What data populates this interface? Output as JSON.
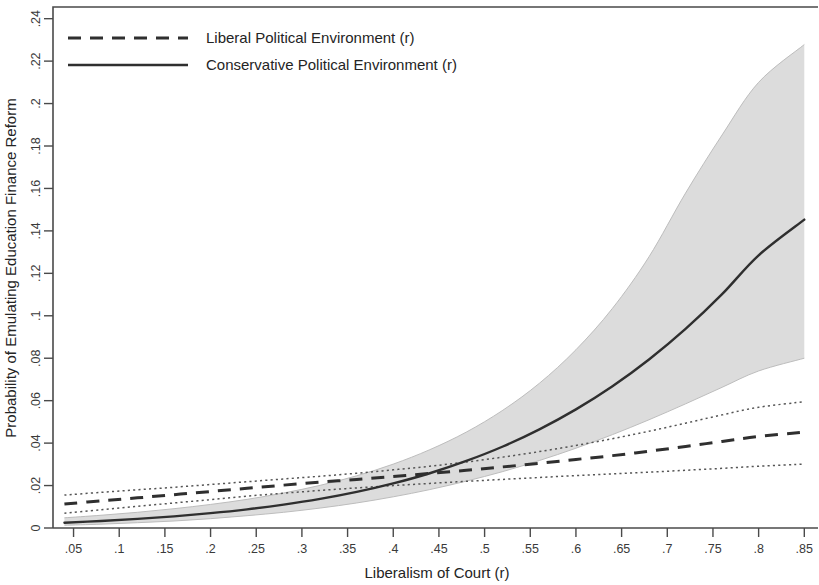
{
  "chart_data": {
    "type": "line",
    "title": "",
    "xlabel": "Liberalism of Court (r)",
    "ylabel": "Probability of Emulating Education Finance Reform",
    "xlim": [
      0.0275,
      0.865
    ],
    "ylim": [
      0,
      0.2455
    ],
    "grid": false,
    "legend_position": "top-left",
    "x_ticks": [
      0.05,
      0.1,
      0.15,
      0.2,
      0.25,
      0.3,
      0.35,
      0.4,
      0.45,
      0.5,
      0.55,
      0.6,
      0.65,
      0.7,
      0.75,
      0.8,
      0.85
    ],
    "x_tick_labels": [
      ".05",
      ".1",
      ".15",
      ".2",
      ".25",
      ".3",
      ".35",
      ".4",
      ".45",
      ".5",
      ".55",
      ".6",
      ".65",
      ".7",
      ".75",
      ".8",
      ".85"
    ],
    "y_ticks": [
      0,
      0.02,
      0.04,
      0.06,
      0.08,
      0.1,
      0.12,
      0.14,
      0.16,
      0.18,
      0.2,
      0.22,
      0.24
    ],
    "y_tick_labels": [
      "0",
      ".02",
      ".04",
      ".06",
      ".08",
      ".1",
      ".12",
      ".14",
      ".16",
      ".18",
      ".2",
      ".22",
      ".24"
    ],
    "x": [
      0.04,
      0.08,
      0.12,
      0.16,
      0.2,
      0.24,
      0.28,
      0.32,
      0.36,
      0.4,
      0.44,
      0.48,
      0.52,
      0.56,
      0.6,
      0.64,
      0.68,
      0.72,
      0.76,
      0.8,
      0.85
    ],
    "series": [
      {
        "name": "Liberal Political Environment (r)",
        "style": "dashed",
        "values": [
          0.0113,
          0.0128,
          0.0142,
          0.0157,
          0.0172,
          0.0187,
          0.0202,
          0.0216,
          0.0229,
          0.0243,
          0.0257,
          0.0272,
          0.0288,
          0.0305,
          0.0323,
          0.0341,
          0.0362,
          0.0384,
          0.0408,
          0.0431,
          0.0452
        ],
        "ci_upper": [
          0.0155,
          0.0168,
          0.018,
          0.0192,
          0.0205,
          0.0218,
          0.0231,
          0.0244,
          0.0258,
          0.0274,
          0.0291,
          0.0311,
          0.0334,
          0.036,
          0.0389,
          0.0421,
          0.0456,
          0.0494,
          0.0533,
          0.0569,
          0.0595
        ],
        "ci_lower": [
          0.007,
          0.0086,
          0.0102,
          0.0118,
          0.0134,
          0.015,
          0.0164,
          0.0177,
          0.0189,
          0.02,
          0.021,
          0.022,
          0.0229,
          0.0238,
          0.0247,
          0.0255,
          0.0263,
          0.0272,
          0.0281,
          0.0291,
          0.0301
        ],
        "ci_style": "dotted"
      },
      {
        "name": "Conservative Political Environment (r)",
        "style": "solid",
        "values": [
          0.0025,
          0.0033,
          0.0043,
          0.0055,
          0.007,
          0.0088,
          0.011,
          0.0137,
          0.017,
          0.021,
          0.0258,
          0.0316,
          0.0384,
          0.0465,
          0.0559,
          0.0668,
          0.0794,
          0.0938,
          0.1102,
          0.1285,
          0.1453
        ],
        "ci_upper": [
          0.0048,
          0.006,
          0.0074,
          0.0091,
          0.0111,
          0.0135,
          0.0165,
          0.0201,
          0.0246,
          0.0301,
          0.0369,
          0.0452,
          0.0555,
          0.0682,
          0.084,
          0.1035,
          0.1278,
          0.1578,
          0.1852,
          0.21,
          0.2278
        ],
        "ci_lower": [
          0.0013,
          0.0018,
          0.0025,
          0.0033,
          0.0044,
          0.0058,
          0.0074,
          0.0094,
          0.0118,
          0.0147,
          0.0181,
          0.0221,
          0.0266,
          0.0318,
          0.0376,
          0.044,
          0.051,
          0.0585,
          0.0663,
          0.074,
          0.08
        ],
        "ci_style": "shaded_band",
        "ci_color": "#d9d9d9"
      }
    ]
  },
  "legend": {
    "items": [
      {
        "label": "Liberal Political Environment (r)",
        "style": "dashed"
      },
      {
        "label": "Conservative Political Environment (r)",
        "style": "solid"
      }
    ]
  },
  "axes": {
    "x_title": "Liberalism of Court (r)",
    "y_title": "Probability of Emulating Education Finance Reform"
  }
}
